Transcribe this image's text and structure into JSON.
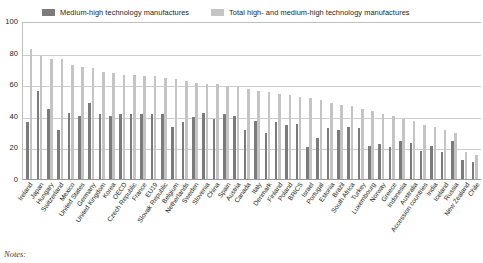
{
  "legend": {
    "entries": [
      {
        "label": "Medium-high technology manufactures",
        "color": "#7b7b7b",
        "key": "medium"
      },
      {
        "label": "Total high- and medium-high technology manufactures",
        "color": "#c4c4c4",
        "key": "total"
      }
    ]
  },
  "axes": {
    "y_ticks": [
      "0",
      "20",
      "40",
      "60",
      "80",
      "100"
    ],
    "y_min": 0,
    "y_max": 100,
    "y_step": 20
  },
  "footer": {
    "notes_label": "Notes:"
  },
  "chart_data": {
    "type": "bar",
    "title": "",
    "subtitle": "",
    "xlabel": "",
    "ylabel": "",
    "ylim": [
      0,
      100
    ],
    "grid": true,
    "legend_position": "top",
    "categories": [
      "Ireland",
      "Japan",
      "Hungary",
      "Switzerland",
      "Mexico",
      "United States",
      "Germany",
      "United Kingdom",
      "Korea",
      "OECD",
      "Czech Republic",
      "France",
      "EU19",
      "Slovak Republic",
      "Belgium",
      "Netherlands",
      "Sweden",
      "Slovenia",
      "China",
      "Spain",
      "Austria",
      "Canada",
      "Italy",
      "Denmark",
      "Finland",
      "Poland",
      "BRICS",
      "Israel",
      "Portugal",
      "Estonia",
      "Brazil",
      "South Africa",
      "Turkey",
      "Luxembourg",
      "Norway",
      "Greece",
      "Indonesia",
      "Australia",
      "Accession countries",
      "India",
      "Iceland",
      "Russia",
      "New Zealand",
      "Chile"
    ],
    "series": [
      {
        "name": "Total high- and medium-high technology manufactures",
        "color": "#c4c4c4",
        "values": [
          82,
          78,
          76,
          76,
          72,
          71,
          70,
          68,
          67,
          66,
          66,
          65,
          65,
          64,
          63,
          62,
          61,
          60,
          60,
          59,
          58,
          57,
          56,
          55,
          54,
          53,
          52,
          51,
          50,
          48,
          47,
          46,
          44,
          43,
          41,
          40,
          38,
          37,
          34,
          33,
          31,
          29,
          17,
          15
        ]
      },
      {
        "name": "Medium-high technology manufactures",
        "color": "#7b7b7b",
        "values": [
          36,
          56,
          44,
          31,
          42,
          40,
          48,
          41,
          40,
          41,
          41,
          41,
          41,
          41,
          33,
          36,
          39,
          42,
          38,
          41,
          40,
          31,
          37,
          29,
          36,
          34,
          35,
          20,
          26,
          32,
          31,
          33,
          32,
          21,
          22,
          20,
          24,
          23,
          18,
          21,
          17,
          24,
          12,
          11
        ]
      }
    ]
  }
}
